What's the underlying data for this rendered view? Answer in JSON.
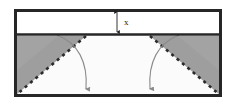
{
  "figure": {
    "background_color": "#ffffff",
    "outline_color": "#262626",
    "shade_color": "#9e9e9e",
    "dash_color": "#2b2b2b",
    "arrow_color": "#7a7a7a",
    "lower_fill_color": "#fbfbfb",
    "upper_fill_color": "#ffffff"
  },
  "outer_frame": {
    "label": "outer-frame",
    "x": 14,
    "y": 9,
    "width": 208,
    "height": 88,
    "stroke_width": 3
  },
  "upper_band": {
    "label": "upper-band",
    "x": 14,
    "y": 9,
    "width": 208,
    "height": 25
  },
  "lower_band": {
    "label": "lower-band",
    "x": 14,
    "y": 34,
    "width": 208,
    "height": 63
  },
  "divider": {
    "label": "horizontal-divider",
    "y": 34,
    "x1": 14,
    "x2": 222,
    "stroke_width": 2.5
  },
  "dimension": {
    "label_text": "x",
    "label_x": 124,
    "label_y": 25,
    "line_x": 117,
    "line_top_y": 11,
    "line_bottom_y": 32,
    "arrowhead_size": 3
  },
  "shaded_regions": [
    {
      "name": "left-corner-shade",
      "points": "16,36 86,36 16,95",
      "corner": "top-left"
    },
    {
      "name": "right-corner-shade",
      "points": "220,36 150,36 220,95",
      "corner": "top-right"
    }
  ],
  "dashed_diagonals": [
    {
      "name": "left-diagonal",
      "x1": 86,
      "y1": 36,
      "x2": 16,
      "y2": 95,
      "dash_pattern": "3 4",
      "stroke_width": 2.6
    },
    {
      "name": "right-diagonal",
      "x1": 150,
      "y1": 36,
      "x2": 220,
      "y2": 95,
      "dash_pattern": "3 4",
      "stroke_width": 2.6
    }
  ],
  "curved_arrows": [
    {
      "name": "left-curved-arrow",
      "path": "M 57 35 C 78 43, 88 62, 86 89",
      "tip_x": 86,
      "tip_y": 92,
      "direction": "down",
      "stroke_width": 1.1
    },
    {
      "name": "right-curved-arrow",
      "path": "M 179 35 C 158 43, 148 62, 150 89",
      "tip_x": 150,
      "tip_y": 92,
      "direction": "down",
      "stroke_width": 1.1
    }
  ]
}
